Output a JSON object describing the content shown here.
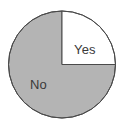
{
  "chart_data": {
    "type": "pie",
    "title": "",
    "subtitle": "",
    "xlabel": "",
    "ylabel": "",
    "legend_position": "none",
    "grid": false,
    "labels_inside": true,
    "categories": [
      "Yes",
      "No"
    ],
    "values": [
      25,
      75
    ],
    "unit": "percent",
    "start_angle_deg": 0,
    "direction": "clockwise",
    "slices": [
      {
        "name": "Yes",
        "label": "Yes",
        "value": 25,
        "fraction": 0.25,
        "angle_deg": 90,
        "fill": "#ffffff",
        "stroke": "#4a4a4a",
        "label_color": "#3a3a3a"
      },
      {
        "name": "No",
        "label": "No",
        "value": 75,
        "fraction": 0.75,
        "angle_deg": 270,
        "fill": "#b4b4b4",
        "stroke": "#4a4a4a",
        "label_color": "#3a3a3a"
      }
    ]
  },
  "figure": {
    "background": "#ffffff",
    "outline_color": "#4a4a4a",
    "center_x": 62,
    "center_y": 64.5,
    "radius": 53.5
  }
}
